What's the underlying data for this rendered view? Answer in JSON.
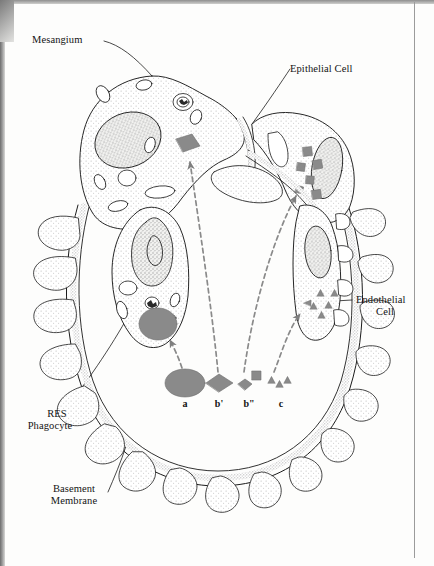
{
  "figure": {
    "type": "diagram",
    "background_color": "#fdfdfc",
    "ink_color": "#1b1b1b",
    "deposit_gray": "#8a8a8a",
    "stipple_gray": "#bdbdbd",
    "nucleus_gray": "#b4b4b4"
  },
  "labels": {
    "mesangium": "Mesangium",
    "epithelial_cell": "Epithelial Cell",
    "endothelial_cell_line1": "Endothelial",
    "endothelial_cell_line2": "Cell",
    "res_phagocyte_line1": "RES",
    "res_phagocyte_line2": "Phagocyte",
    "basement_membrane_line1": "Basement",
    "basement_membrane_line2": "Membrane"
  },
  "key": {
    "items": [
      {
        "id": "a",
        "label": "a",
        "shape": "ellipse",
        "color": "#8a8a8a",
        "meaning": "large soluble complex taken up by RES phagocyte"
      },
      {
        "id": "b1",
        "label": "b'",
        "shape": "diamond",
        "color": "#8a8a8a",
        "meaning": "intermediate complex deposited in mesangium"
      },
      {
        "id": "b2",
        "label": "b\"",
        "shape": "diamond-square",
        "color": "#8a8a8a",
        "meaning": "complex deposited subepithelially"
      },
      {
        "id": "c",
        "label": "c",
        "shape": "triangle-cluster",
        "color": "#8a8a8a",
        "meaning": "small complex trapped subendothelially"
      }
    ]
  },
  "deposits": {
    "mesangial_diamond": "b'",
    "subepithelial_squares": "b\"",
    "subendothelial_triangles": "c",
    "phagocyte_vacuole": "a"
  },
  "arrows": [
    {
      "name": "phagocyte-uptake-arrow",
      "from": "a",
      "to": "RES Phagocyte vacuole",
      "style": "dashed"
    },
    {
      "name": "mesangial-deposit-arrow",
      "from": "b'",
      "to": "Mesangium",
      "style": "dashed"
    },
    {
      "name": "subepithelial-arrow",
      "from": "b\"",
      "to": "Epithelial Cell",
      "style": "dashed"
    },
    {
      "name": "subendothelial-arrow",
      "from": "c",
      "to": "Endothelial Cell",
      "style": "dashed"
    }
  ]
}
